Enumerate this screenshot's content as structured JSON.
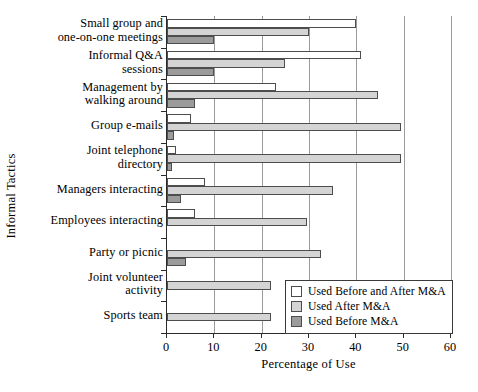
{
  "chart_data": {
    "type": "bar",
    "orientation": "horizontal",
    "title": "",
    "xlabel": "Percentage of Use",
    "ylabel": "Informal Tactics",
    "xlim": [
      0,
      60
    ],
    "xticks": [
      0,
      10,
      20,
      30,
      40,
      50,
      60
    ],
    "xtick_labels": [
      "0",
      "10",
      "20",
      "30",
      "40",
      "50",
      "60"
    ],
    "grid": true,
    "grid_axis": "x",
    "legend_position": "lower right",
    "categories": [
      "Small group and\none-on-one meetings",
      "Informal Q&A\nsessions",
      "Management by\nwalking around",
      "Group e-mails",
      "Joint telephone\ndirectory",
      "Managers interacting",
      "Employees interacting",
      "Party or picnic",
      "Joint volunteer\nactivity",
      "Sports team"
    ],
    "series": [
      {
        "name": "Used Before and After M&A",
        "color": "#ffffff",
        "values": [
          40,
          41,
          23,
          5,
          2,
          8,
          6,
          0,
          0,
          0
        ]
      },
      {
        "name": "Used After M&A",
        "color": "#d4d4d4",
        "values": [
          30,
          25,
          44.5,
          49.5,
          49.5,
          35,
          29.5,
          32.5,
          22,
          22
        ]
      },
      {
        "name": "Used Before M&A",
        "color": "#9b9b9b",
        "values": [
          10,
          10,
          6,
          1.5,
          1,
          3,
          0,
          4,
          0,
          0
        ]
      }
    ]
  },
  "legend": {
    "items": [
      {
        "label": "Used Before and After M&A",
        "swatch": "before-after"
      },
      {
        "label": "Used After M&A",
        "swatch": "after"
      },
      {
        "label": "Used Before M&A",
        "swatch": "before"
      }
    ]
  }
}
